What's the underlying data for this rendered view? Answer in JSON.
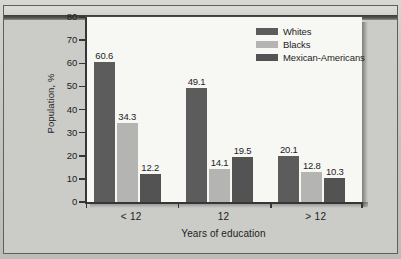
{
  "chart_data": {
    "type": "bar",
    "title": "",
    "xlabel": "Years of education",
    "ylabel": "Population, %",
    "categories": [
      "< 12",
      "12",
      "> 12"
    ],
    "series": [
      {
        "name": "Whites",
        "color": "#5c5c5c",
        "values": [
          60.6,
          49.1,
          20.1
        ]
      },
      {
        "name": "Blacks",
        "color": "#b4b4b2",
        "values": [
          34.3,
          14.1,
          12.8
        ]
      },
      {
        "name": "Mexican-Americans",
        "color": "#535353",
        "values": [
          12.2,
          19.5,
          10.3
        ]
      }
    ],
    "value_labels": [
      [
        "60.6",
        "34.3",
        "12.2"
      ],
      [
        "49.1",
        "14.1",
        "19.5"
      ],
      [
        "20.1",
        "12.8",
        "10.3"
      ]
    ],
    "ylim": [
      0,
      80
    ],
    "yticks": [
      0,
      10,
      20,
      30,
      40,
      50,
      60,
      70,
      80
    ],
    "ytick_labels": [
      "0",
      "10",
      "20",
      "30",
      "40",
      "50",
      "60",
      "70",
      "80"
    ],
    "grid": false,
    "legend_position": "top-right",
    "colors": {
      "plot_background": "#f7f7f4",
      "figure_background": "#c6c6c2",
      "axis": "#35353a",
      "text": "#1d1d1f"
    }
  }
}
